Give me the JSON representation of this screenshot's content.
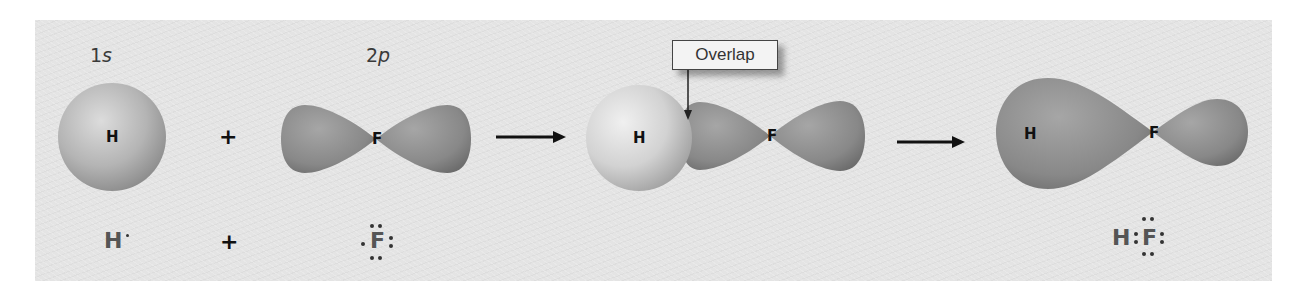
{
  "figure": {
    "panel_background": "#e4e4e4",
    "orbital_color": "#8c8c8c",
    "h_sphere_color": "#c8c8c8"
  },
  "step1": {
    "h_orbital_label_num": "1",
    "h_orbital_label_letter": "s",
    "h_atom": "H",
    "plus1": "+",
    "f_orbital_label_num": "2",
    "f_orbital_label_letter": "p",
    "f_atom": "F",
    "lewis_h": "H",
    "plus2": "+",
    "lewis_f": "F"
  },
  "step2": {
    "arrow": "→",
    "callout": "Overlap",
    "h_atom": "H",
    "f_atom": "F"
  },
  "step3": {
    "arrow": "→",
    "h_atom": "H",
    "f_atom": "F",
    "lewis_h": "H",
    "lewis_f": "F"
  }
}
